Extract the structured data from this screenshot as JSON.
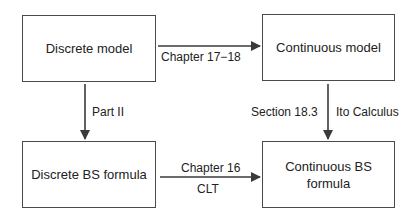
{
  "diagram": {
    "nodes": [
      {
        "id": "discrete-model",
        "label": "Discrete model"
      },
      {
        "id": "continuous-model",
        "label": "Continuous model"
      },
      {
        "id": "discrete-bs-formula",
        "label": "Discrete BS formula"
      },
      {
        "id": "continuous-bs-formula",
        "label": "Continuous BS\nformula"
      }
    ],
    "edges": [
      {
        "from": "discrete-model",
        "to": "continuous-model",
        "labels": [
          "Chapter 17−18"
        ]
      },
      {
        "from": "discrete-model",
        "to": "discrete-bs-formula",
        "labels": [
          "Part II"
        ]
      },
      {
        "from": "continuous-model",
        "to": "continuous-bs-formula",
        "labels": [
          "Section 18.3",
          "Ito Calculus"
        ]
      },
      {
        "from": "discrete-bs-formula",
        "to": "continuous-bs-formula",
        "labels": [
          "Chapter 16",
          "CLT"
        ]
      }
    ]
  },
  "colors": {
    "stroke": "#4a4a4a",
    "text": "#222222",
    "background": "#ffffff"
  }
}
